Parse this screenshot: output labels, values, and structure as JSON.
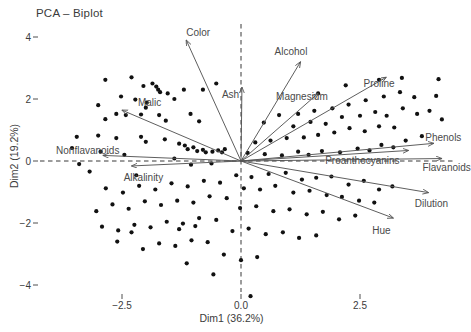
{
  "chart_data": {
    "type": "scatter",
    "title": "PCA – Biplot",
    "subtitle": "",
    "xlabel": "Dim1 (36.2%)",
    "ylabel": "Dim2 (19.2%)",
    "xlim": [
      -3.9,
      4.7
    ],
    "ylim": [
      -4.9,
      4.6
    ],
    "grid": false,
    "legend": "none",
    "xticks": [
      -2.5,
      0.0,
      2.5
    ],
    "xticklabels": [
      "−2.5",
      "0.0",
      "2.5"
    ],
    "yticks": [
      4,
      2,
      0,
      -2,
      -4
    ],
    "yticklabels": [
      "4",
      "2",
      "0",
      "−2",
      "−4"
    ],
    "reference_lines": {
      "vertical_x": 0.0,
      "horizontal_y": 0.0,
      "style": "dashed"
    },
    "point_color": "#111111",
    "arrow_color": "#555555",
    "point_radius": 2.1,
    "points": [
      [
        -2.85,
        2.62
      ],
      [
        -2.3,
        2.7
      ],
      [
        -2.05,
        2.42
      ],
      [
        -1.86,
        2.5
      ],
      [
        -1.78,
        2.4
      ],
      [
        -1.74,
        2.3
      ],
      [
        -1.7,
        2.22
      ],
      [
        -1.54,
        2.18
      ],
      [
        -2.52,
        2.08
      ],
      [
        -3.0,
        1.8
      ],
      [
        -2.22,
        1.98
      ],
      [
        -1.98,
        1.88
      ],
      [
        -2.0,
        1.72
      ],
      [
        -1.4,
        2.0
      ],
      [
        -1.2,
        2.3
      ],
      [
        -0.8,
        2.3
      ],
      [
        -0.52,
        2.5
      ],
      [
        -2.62,
        1.52
      ],
      [
        -2.42,
        1.48
      ],
      [
        -2.85,
        1.35
      ],
      [
        -2.1,
        1.5
      ],
      [
        -1.72,
        1.48
      ],
      [
        -1.58,
        1.3
      ],
      [
        -1.06,
        1.52
      ],
      [
        -0.88,
        1.28
      ],
      [
        -3.45,
        0.78
      ],
      [
        -3.0,
        0.82
      ],
      [
        -2.62,
        0.74
      ],
      [
        -2.1,
        0.78
      ],
      [
        -2.0,
        0.62
      ],
      [
        -1.6,
        0.7
      ],
      [
        -1.3,
        0.56
      ],
      [
        -1.18,
        0.5
      ],
      [
        -1.12,
        0.38
      ],
      [
        -1.0,
        0.44
      ],
      [
        -0.92,
        0.32
      ],
      [
        -0.8,
        0.36
      ],
      [
        -0.74,
        0.28
      ],
      [
        -0.6,
        0.3
      ],
      [
        -0.48,
        0.34
      ],
      [
        -0.4,
        0.28
      ],
      [
        -0.34,
        0.38
      ],
      [
        -2.95,
        0.3
      ],
      [
        -2.45,
        0.2
      ],
      [
        -1.4,
        0.08
      ],
      [
        -1.05,
        -0.12
      ],
      [
        -0.62,
        -0.08
      ],
      [
        0.14,
        0.26
      ],
      [
        0.5,
        0.22
      ],
      [
        0.86,
        0.18
      ],
      [
        1.2,
        0.3
      ],
      [
        1.42,
        0.2
      ],
      [
        1.7,
        0.32
      ],
      [
        2.08,
        0.28
      ],
      [
        2.45,
        0.4
      ],
      [
        2.7,
        0.34
      ],
      [
        2.95,
        0.52
      ],
      [
        3.2,
        0.44
      ],
      [
        3.46,
        0.66
      ],
      [
        3.8,
        0.8
      ],
      [
        3.22,
        1.08
      ],
      [
        2.9,
        1.12
      ],
      [
        2.6,
        0.96
      ],
      [
        2.28,
        1.06
      ],
      [
        1.96,
        0.92
      ],
      [
        1.62,
        0.84
      ],
      [
        1.32,
        0.76
      ],
      [
        0.96,
        0.74
      ],
      [
        0.62,
        0.66
      ],
      [
        0.3,
        0.6
      ],
      [
        1.1,
        1.12
      ],
      [
        1.46,
        1.26
      ],
      [
        1.78,
        1.2
      ],
      [
        2.12,
        1.42
      ],
      [
        2.5,
        1.46
      ],
      [
        2.82,
        1.58
      ],
      [
        3.06,
        1.46
      ],
      [
        3.4,
        1.7
      ],
      [
        3.7,
        1.52
      ],
      [
        2.26,
        1.82
      ],
      [
        2.62,
        1.96
      ],
      [
        3.0,
        2.08
      ],
      [
        3.34,
        2.22
      ],
      [
        3.64,
        2.06
      ],
      [
        4.1,
        2.1
      ],
      [
        3.96,
        1.62
      ],
      [
        4.22,
        1.34
      ],
      [
        1.92,
        1.7
      ],
      [
        1.54,
        1.62
      ],
      [
        1.2,
        1.52
      ],
      [
        2.9,
        2.62
      ],
      [
        3.38,
        2.68
      ],
      [
        4.15,
        2.64
      ],
      [
        0.8,
        1.48
      ],
      [
        0.48,
        1.24
      ],
      [
        2.2,
        2.44
      ],
      [
        1.62,
        2.18
      ],
      [
        -0.1,
        -0.46
      ],
      [
        0.22,
        -0.52
      ],
      [
        0.58,
        -0.42
      ],
      [
        0.94,
        -0.38
      ],
      [
        1.28,
        -0.6
      ],
      [
        1.58,
        -0.54
      ],
      [
        1.9,
        -0.5
      ],
      [
        2.26,
        -0.76
      ],
      [
        2.58,
        -0.64
      ],
      [
        2.9,
        -0.92
      ],
      [
        3.18,
        -0.82
      ],
      [
        0.06,
        -0.88
      ],
      [
        0.4,
        -0.92
      ],
      [
        0.72,
        -0.8
      ],
      [
        1.1,
        -1.02
      ],
      [
        1.44,
        -0.96
      ],
      [
        1.8,
        -1.1
      ],
      [
        2.12,
        -1.16
      ],
      [
        2.48,
        -1.28
      ],
      [
        2.8,
        -1.34
      ],
      [
        -0.44,
        -0.7
      ],
      [
        -0.78,
        -0.64
      ],
      [
        -1.12,
        -0.82
      ],
      [
        -1.46,
        -0.72
      ],
      [
        -1.8,
        -0.92
      ],
      [
        -2.14,
        -0.8
      ],
      [
        -2.48,
        -1.02
      ],
      [
        -2.84,
        -0.88
      ],
      [
        -0.3,
        -1.2
      ],
      [
        -0.66,
        -1.14
      ],
      [
        -1.0,
        -1.34
      ],
      [
        -1.34,
        -1.28
      ],
      [
        -1.68,
        -1.42
      ],
      [
        -2.02,
        -1.3
      ],
      [
        -2.36,
        -1.54
      ],
      [
        -2.7,
        -1.4
      ],
      [
        -3.04,
        -1.62
      ],
      [
        -0.02,
        -1.52
      ],
      [
        0.32,
        -1.46
      ],
      [
        0.68,
        -1.62
      ],
      [
        1.02,
        -1.56
      ],
      [
        1.38,
        -1.72
      ],
      [
        1.72,
        -1.64
      ],
      [
        2.06,
        -1.88
      ],
      [
        2.4,
        -1.76
      ],
      [
        -0.52,
        -1.9
      ],
      [
        -0.88,
        -1.84
      ],
      [
        -1.22,
        -2.02
      ],
      [
        -1.56,
        -1.96
      ],
      [
        -1.9,
        -2.14
      ],
      [
        -2.24,
        -2.06
      ],
      [
        -2.58,
        -2.24
      ],
      [
        -2.92,
        -2.12
      ],
      [
        -0.18,
        -2.26
      ],
      [
        0.16,
        -2.18
      ],
      [
        0.52,
        -2.36
      ],
      [
        0.88,
        -2.3
      ],
      [
        1.22,
        -2.48
      ],
      [
        1.58,
        -2.4
      ],
      [
        -0.7,
        -2.62
      ],
      [
        -1.04,
        -2.56
      ],
      [
        -1.38,
        -2.74
      ],
      [
        -1.72,
        -2.66
      ],
      [
        -2.06,
        -2.84
      ],
      [
        -0.36,
        -3.02
      ],
      [
        0.0,
        -3.2
      ],
      [
        0.34,
        -3.1
      ],
      [
        -1.14,
        -3.3
      ],
      [
        -0.58,
        -3.66
      ],
      [
        0.2,
        -4.36
      ],
      [
        -2.3,
        -2.3
      ],
      [
        -2.6,
        -2.6
      ],
      [
        -0.96,
        -2.1
      ],
      [
        -1.3,
        -2.2
      ],
      [
        -3.18,
        -0.34
      ],
      [
        -3.4,
        -0.1
      ],
      [
        -3.55,
        0.42
      ],
      [
        -2.2,
        -0.46
      ]
    ],
    "variables": [
      {
        "name": "Color",
        "tip_x": -1.15,
        "tip_y": 3.9,
        "label_x": -0.9,
        "label_y": 4.17
      },
      {
        "name": "Ash",
        "tip_x": 0.02,
        "tip_y": 2.38,
        "label_x": -0.22,
        "label_y": 2.16
      },
      {
        "name": "Alcohol",
        "tip_x": 1.25,
        "tip_y": 3.2,
        "label_x": 1.05,
        "label_y": 3.55
      },
      {
        "name": "Magnesium",
        "tip_x": 1.62,
        "tip_y": 2.18,
        "label_x": 1.28,
        "label_y": 2.1
      },
      {
        "name": "Proline",
        "tip_x": 3.05,
        "tip_y": 2.7,
        "label_x": 2.9,
        "label_y": 2.53
      },
      {
        "name": "Phenols",
        "tip_x": 4.05,
        "tip_y": 0.57,
        "label_x": 4.25,
        "label_y": 0.76
      },
      {
        "name": "Flavanoids",
        "tip_x": 4.22,
        "tip_y": 0.08,
        "label_x": 4.32,
        "label_y": -0.2
      },
      {
        "name": "Proanthocyanins",
        "tip_x": 3.52,
        "tip_y": 0.34,
        "label_x": 2.55,
        "label_y": 0.02
      },
      {
        "name": "Dilution",
        "tip_x": 3.94,
        "tip_y": -1.02,
        "label_x": 4.0,
        "label_y": -1.36
      },
      {
        "name": "Hue",
        "tip_x": 3.2,
        "tip_y": -1.84,
        "label_x": 2.95,
        "label_y": -2.22
      },
      {
        "name": "Malic",
        "tip_x": -2.5,
        "tip_y": 1.64,
        "label_x": -1.92,
        "label_y": 1.9
      },
      {
        "name": "Nonflavanoids",
        "tip_x": -2.9,
        "tip_y": 0.18,
        "label_x": -3.22,
        "label_y": 0.36
      },
      {
        "name": "Alkalinity",
        "tip_x": -2.3,
        "tip_y": -0.16,
        "label_x": -2.05,
        "label_y": -0.5
      }
    ]
  }
}
